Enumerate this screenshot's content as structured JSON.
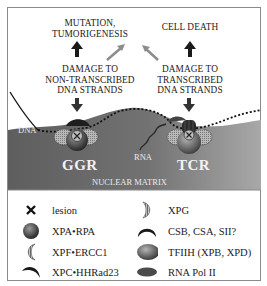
{
  "top_labels": {
    "left_outcome": [
      "MUTATION,",
      "TUMORIGENESIS"
    ],
    "right_outcome": [
      "CELL DEATH"
    ],
    "left_damage": [
      "DAMAGE TO",
      "NON-TRANSCRIBED",
      "DNA STRANDS"
    ],
    "right_damage": [
      "DAMAGE TO",
      "TRANSCRIBED",
      "DNA STRANDS"
    ]
  },
  "diagram": {
    "dna_label": "DNA",
    "rna_label": "RNA",
    "ggr_label": "GGR",
    "tcr_label": "TCR",
    "matrix_label": "NUCLEAR MATRIX"
  },
  "legend": {
    "left": [
      {
        "icon": "lesion-x-icon",
        "label": "lesion"
      },
      {
        "icon": "xpa-rpa-sphere-icon",
        "label": "XPA•RPA"
      },
      {
        "icon": "xpf-ercc1-crescent-icon",
        "label": "XPF•ERCC1"
      },
      {
        "icon": "xpc-hhrad23-crescent-icon",
        "label": "XPC•HHRad23"
      }
    ],
    "right": [
      {
        "icon": "xpg-crescent-icon",
        "label": "XPG"
      },
      {
        "icon": "csb-csa-arc-icon",
        "label": "CSB, CSA, SII?"
      },
      {
        "icon": "tfiih-ellipse-icon",
        "label": "TFIIH (XPB, XPD)"
      },
      {
        "icon": "rna-pol-ii-ellipse-icon",
        "label": "RNA Pol II"
      }
    ]
  },
  "colors": {
    "matrix": "#6e6e6e",
    "matrix_light": "#9a9a9a",
    "arrow_dark": "#1a1a1a",
    "arrow_gray": "#8c8c8c",
    "frame": "#8a8a8a"
  }
}
